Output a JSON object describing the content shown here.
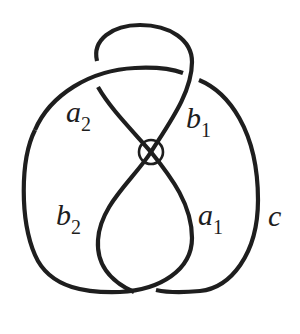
{
  "diagram": {
    "type": "virtual knot diagram",
    "stroke_color": "#1e1e1e",
    "background": "#ffffff",
    "virtual_crossing": {
      "symbol": "circled crossing",
      "cx": 151,
      "cy": 152,
      "r": 12
    },
    "labels": {
      "a2": {
        "main": "a",
        "sub": "2"
      },
      "b1": {
        "main": "b",
        "sub": "1"
      },
      "b2": {
        "main": "b",
        "sub": "2"
      },
      "a1": {
        "main": "a",
        "sub": "1"
      },
      "c": {
        "main": "c",
        "sub": ""
      }
    }
  }
}
